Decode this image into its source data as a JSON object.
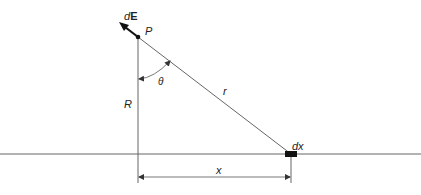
{
  "diagram": {
    "labels": {
      "dE_prefix": "d",
      "dE_vector": "E",
      "point": "P",
      "angle": "θ",
      "perp_distance": "R",
      "distance": "r",
      "element": "dx",
      "horizontal_distance": "x"
    },
    "colors": {
      "line": "#555555",
      "arrow": "#111111",
      "text": "#222222"
    }
  }
}
